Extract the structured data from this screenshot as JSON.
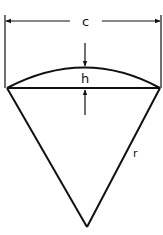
{
  "diagram": {
    "labels": {
      "chord": "c",
      "height": "h",
      "radius": "r"
    },
    "colors": {
      "stroke": "#111111",
      "background": "#ffffff"
    }
  }
}
